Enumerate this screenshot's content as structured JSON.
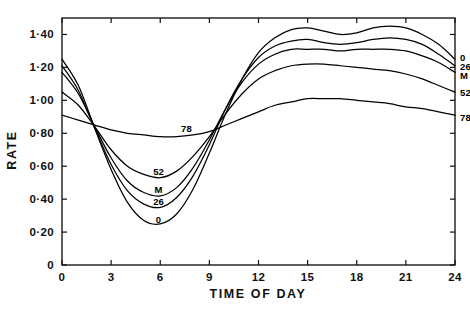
{
  "chart_data": {
    "type": "line",
    "title": "",
    "xlabel": "TIME OF DAY",
    "ylabel": "RATE",
    "xlim": [
      0,
      24
    ],
    "ylim": [
      0,
      1.5
    ],
    "grid": false,
    "legend_position": "right-edge-inline",
    "x_ticks": [
      "0",
      "3",
      "6",
      "9",
      "12",
      "15",
      "18",
      "21",
      "24"
    ],
    "x_tick_values": [
      0,
      3,
      6,
      9,
      12,
      15,
      18,
      21,
      24
    ],
    "y_ticks": [
      "0",
      "0·20",
      "0·40",
      "0·60",
      "0·80",
      "1·00",
      "1·20",
      "1·40"
    ],
    "y_tick_values": [
      0,
      0.2,
      0.4,
      0.6,
      0.8,
      1.0,
      1.2,
      1.4
    ],
    "x": [
      0,
      1,
      2,
      3,
      4,
      5,
      6,
      7,
      8,
      9,
      10,
      11,
      12,
      13,
      14,
      15,
      16,
      17,
      18,
      19,
      20,
      21,
      22,
      23,
      24
    ],
    "series": [
      {
        "name": "0",
        "label": "0",
        "inline_label_trough": "0",
        "inline_label_right": "0",
        "values": [
          1.25,
          1.09,
          0.83,
          0.58,
          0.38,
          0.27,
          0.25,
          0.31,
          0.46,
          0.68,
          0.92,
          1.13,
          1.29,
          1.38,
          1.43,
          1.44,
          1.42,
          1.4,
          1.41,
          1.44,
          1.45,
          1.44,
          1.4,
          1.34,
          1.25
        ]
      },
      {
        "name": "26",
        "label": "26",
        "inline_label_trough": "26",
        "inline_label_right": "26",
        "values": [
          1.21,
          1.06,
          0.83,
          0.61,
          0.45,
          0.37,
          0.35,
          0.41,
          0.54,
          0.73,
          0.95,
          1.13,
          1.26,
          1.33,
          1.36,
          1.37,
          1.35,
          1.34,
          1.35,
          1.37,
          1.38,
          1.37,
          1.34,
          1.28,
          1.21
        ]
      },
      {
        "name": "M",
        "label": "M",
        "inline_label_trough": "M",
        "inline_label_right": "M",
        "values": [
          1.17,
          1.04,
          0.84,
          0.65,
          0.51,
          0.44,
          0.42,
          0.47,
          0.59,
          0.76,
          0.95,
          1.11,
          1.22,
          1.28,
          1.31,
          1.31,
          1.31,
          1.3,
          1.31,
          1.31,
          1.31,
          1.3,
          1.27,
          1.23,
          1.17
        ]
      },
      {
        "name": "52",
        "label": "52",
        "inline_label_trough": "52",
        "inline_label_right": "52",
        "values": [
          1.05,
          0.97,
          0.84,
          0.7,
          0.6,
          0.55,
          0.53,
          0.57,
          0.66,
          0.78,
          0.92,
          1.04,
          1.13,
          1.18,
          1.21,
          1.22,
          1.22,
          1.21,
          1.2,
          1.19,
          1.18,
          1.16,
          1.13,
          1.09,
          1.05
        ]
      },
      {
        "name": "78",
        "label": "78",
        "inline_label_trough": "78",
        "inline_label_right": "78",
        "values": [
          0.91,
          0.88,
          0.85,
          0.82,
          0.8,
          0.79,
          0.78,
          0.78,
          0.79,
          0.81,
          0.85,
          0.89,
          0.93,
          0.97,
          0.99,
          1.01,
          1.01,
          1.01,
          1.0,
          0.99,
          0.98,
          0.96,
          0.95,
          0.93,
          0.91
        ]
      }
    ],
    "annotations": [
      {
        "text": "52",
        "x": 5.9,
        "y": 0.565,
        "position": "trough"
      },
      {
        "text": "M",
        "x": 5.9,
        "y": 0.455,
        "position": "trough"
      },
      {
        "text": "26",
        "x": 5.9,
        "y": 0.385,
        "position": "trough"
      },
      {
        "text": "0",
        "x": 5.9,
        "y": 0.275,
        "position": "trough"
      },
      {
        "text": "78",
        "x": 7.6,
        "y": 0.825,
        "position": "trough"
      },
      {
        "text": "0",
        "x": 24.3,
        "y": 1.255,
        "position": "right"
      },
      {
        "text": "26",
        "x": 24.3,
        "y": 1.205,
        "position": "right"
      },
      {
        "text": "M",
        "x": 24.3,
        "y": 1.145,
        "position": "right"
      },
      {
        "text": "52",
        "x": 24.3,
        "y": 1.045,
        "position": "right"
      },
      {
        "text": "78",
        "x": 24.3,
        "y": 0.895,
        "position": "right"
      }
    ],
    "colors": {
      "curve": "#000000",
      "axis": "#111111",
      "background": "#ffffff"
    }
  }
}
